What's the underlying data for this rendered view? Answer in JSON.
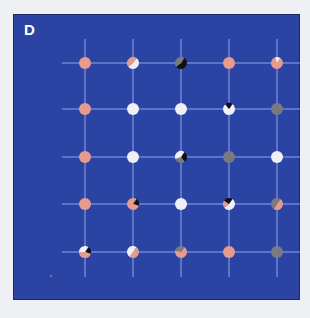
{
  "panel": {
    "label": "D",
    "background": "#2b44a3",
    "line_color": "#8fa6ee"
  },
  "colors": {
    "pink": "#e89a8c",
    "white": "#eef0f6",
    "gray": "#7a7a80",
    "black": "#111111"
  },
  "grid": {
    "columns_x": [
      71,
      119,
      167,
      215,
      263
    ],
    "rows_y": [
      48,
      94,
      142,
      189,
      237
    ],
    "h_line_x_range": [
      48,
      286
    ],
    "v_line_y_range": [
      24,
      262
    ],
    "dot_radius": 6
  },
  "dots": [
    {
      "row": 0,
      "col": 0,
      "segments": [
        [
          "pink",
          1
        ]
      ]
    },
    {
      "row": 0,
      "col": 1,
      "segments": [
        [
          "white",
          0.55
        ],
        [
          "pink",
          0.45
        ]
      ]
    },
    {
      "row": 0,
      "col": 2,
      "segments": [
        [
          "black",
          0.55
        ],
        [
          "gray",
          0.45
        ]
      ]
    },
    {
      "row": 0,
      "col": 3,
      "segments": [
        [
          "pink",
          1
        ]
      ]
    },
    {
      "row": 0,
      "col": 4,
      "segments": [
        [
          "pink",
          0.85
        ],
        [
          "white",
          0.15
        ]
      ]
    },
    {
      "row": 1,
      "col": 0,
      "segments": [
        [
          "pink",
          1
        ]
      ]
    },
    {
      "row": 1,
      "col": 1,
      "segments": [
        [
          "white",
          1
        ]
      ]
    },
    {
      "row": 1,
      "col": 2,
      "segments": [
        [
          "white",
          1
        ]
      ]
    },
    {
      "row": 1,
      "col": 3,
      "segments": [
        [
          "white",
          0.8
        ],
        [
          "black",
          0.2
        ]
      ]
    },
    {
      "row": 1,
      "col": 4,
      "segments": [
        [
          "gray",
          1
        ]
      ]
    },
    {
      "row": 2,
      "col": 0,
      "segments": [
        [
          "pink",
          1
        ]
      ]
    },
    {
      "row": 2,
      "col": 1,
      "segments": [
        [
          "white",
          1
        ]
      ]
    },
    {
      "row": 2,
      "col": 2,
      "segments": [
        [
          "black",
          0.3
        ],
        [
          "gray",
          0.3
        ],
        [
          "white",
          0.4
        ]
      ]
    },
    {
      "row": 2,
      "col": 3,
      "segments": [
        [
          "gray",
          1
        ]
      ]
    },
    {
      "row": 2,
      "col": 4,
      "segments": [
        [
          "white",
          1
        ]
      ]
    },
    {
      "row": 3,
      "col": 0,
      "segments": [
        [
          "pink",
          1
        ]
      ]
    },
    {
      "row": 3,
      "col": 1,
      "segments": [
        [
          "black",
          0.2
        ],
        [
          "pink",
          0.8
        ]
      ]
    },
    {
      "row": 3,
      "col": 2,
      "segments": [
        [
          "white",
          1
        ]
      ]
    },
    {
      "row": 3,
      "col": 3,
      "segments": [
        [
          "white",
          0.55
        ],
        [
          "pink",
          0.2
        ],
        [
          "black",
          0.25
        ]
      ]
    },
    {
      "row": 3,
      "col": 4,
      "segments": [
        [
          "pink",
          0.5
        ],
        [
          "gray",
          0.5
        ]
      ]
    },
    {
      "row": 4,
      "col": 0,
      "segments": [
        [
          "black",
          0.2
        ],
        [
          "pink",
          0.45
        ],
        [
          "white",
          0.35
        ]
      ]
    },
    {
      "row": 4,
      "col": 1,
      "segments": [
        [
          "pink",
          0.5
        ],
        [
          "white",
          0.5
        ]
      ]
    },
    {
      "row": 4,
      "col": 2,
      "segments": [
        [
          "pink",
          0.7
        ],
        [
          "gray",
          0.3
        ]
      ]
    },
    {
      "row": 4,
      "col": 3,
      "segments": [
        [
          "pink",
          1
        ]
      ]
    },
    {
      "row": 4,
      "col": 4,
      "segments": [
        [
          "gray",
          1
        ]
      ]
    }
  ],
  "speck": {
    "x": 37,
    "y": 261,
    "color": "#c07090"
  }
}
